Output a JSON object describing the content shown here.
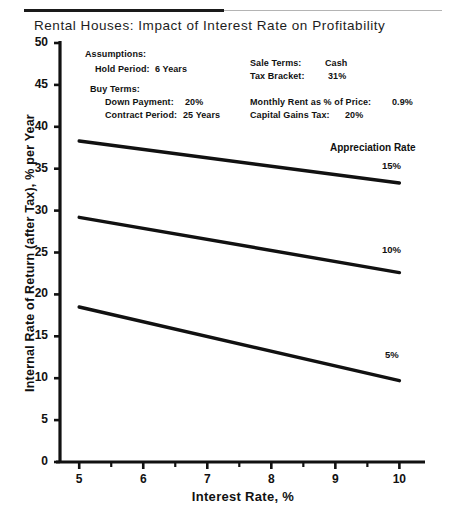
{
  "document": {
    "title": "Rental Houses: Impact of Interest Rate on Profitability",
    "divider": {
      "dark_color": "#1a1a1a",
      "light_color": "#b4b4b4"
    }
  },
  "assumptions": {
    "heading": "Assumptions:",
    "left_column": [
      {
        "label": "Hold Period:",
        "value": "6 Years"
      },
      {
        "label": "Buy Terms:",
        "value": ""
      },
      {
        "label": "Down Payment:",
        "value": "20%"
      },
      {
        "label": "Contract Period:",
        "value": "25 Years"
      }
    ],
    "right_column": [
      {
        "label": "Sale Terms:",
        "value": "Cash"
      },
      {
        "label": "Tax Bracket:",
        "value": "31%"
      },
      {
        "label": "Monthly Rent as % of Price:",
        "value": "0.9%"
      },
      {
        "label": "Capital Gains Tax:",
        "value": "20%"
      }
    ]
  },
  "legend": {
    "title": "Appreciation Rate",
    "entries": [
      {
        "label": "15%"
      },
      {
        "label": "10%"
      },
      {
        "label": "5%"
      }
    ]
  },
  "chart_data": {
    "type": "line",
    "title": "Rental Houses: Impact of Interest Rate on Profitability",
    "xlabel": "Interest Rate, %",
    "ylabel": "Internal Rate of Return (after Tax), % per Year",
    "xlim": [
      4.7,
      10.4
    ],
    "ylim": [
      0,
      50
    ],
    "xticks": [
      5,
      6,
      7,
      8,
      9,
      10
    ],
    "xticklabels": [
      "5",
      "6",
      "7",
      "8",
      "9",
      "10"
    ],
    "xminorticks": [
      5.5,
      6.5,
      7.5,
      8.5,
      9.5
    ],
    "yticks": [
      0,
      5,
      10,
      15,
      20,
      25,
      30,
      35,
      40,
      45,
      50
    ],
    "yticklabels": [
      "0",
      "5",
      "10",
      "15",
      "20",
      "25",
      "30",
      "35",
      "40",
      "45",
      "50"
    ],
    "grid": false,
    "legend_position": "right-inline",
    "x": [
      5,
      10
    ],
    "series": [
      {
        "name": "15%",
        "values": [
          38.3,
          33.3
        ],
        "color": "#111111"
      },
      {
        "name": "10%",
        "values": [
          29.2,
          22.6
        ],
        "color": "#111111"
      },
      {
        "name": "5%",
        "values": [
          18.5,
          9.7
        ],
        "color": "#111111"
      }
    ]
  }
}
